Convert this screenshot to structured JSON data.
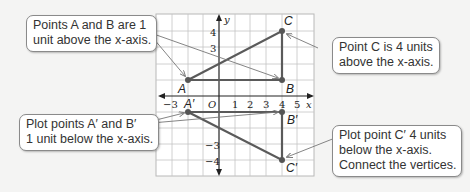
{
  "callouts": {
    "ab": {
      "line1": "Points A and B are 1",
      "line2": "unit above the x-axis."
    },
    "c": {
      "line1": "Point C is 4 units",
      "line2": "above the x-axis."
    },
    "ab_prime": {
      "line1": "Plot points A′ and B′",
      "line2": "1 unit below the x-axis."
    },
    "c_prime": {
      "line1": "Plot point C′ 4 units",
      "line2": "below the x-axis.",
      "line3": "Connect the vertices."
    }
  },
  "axes": {
    "x_label": "x",
    "y_label": "y",
    "origin_label": "O",
    "x_ticks": [
      "−3",
      "1",
      "2",
      "3",
      "4",
      "5"
    ],
    "y_ticks": [
      "4",
      "3",
      "−3",
      "−4"
    ]
  },
  "points": {
    "A": {
      "label": "A",
      "x": -2,
      "y": 1
    },
    "B": {
      "label": "B",
      "x": 4,
      "y": 1
    },
    "C": {
      "label": "C",
      "x": 4,
      "y": 4
    },
    "A_prime": {
      "label": "A′",
      "x": -2,
      "y": -1
    },
    "B_prime": {
      "label": "B′",
      "x": 4,
      "y": -1
    },
    "C_prime": {
      "label": "C′",
      "x": 4,
      "y": -4
    }
  },
  "colors": {
    "triangle": "#5a5a5a",
    "grid": "#b8b8b8",
    "arrow": "#777777",
    "background": "#f4f4f3"
  }
}
